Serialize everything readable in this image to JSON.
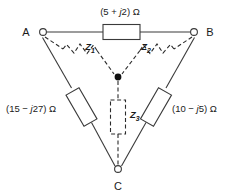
{
  "figure": {
    "stroke_color": "#3a3a3a",
    "dashed_color": "#2b2b2b",
    "text_color": "#1a1a1a",
    "background": "#ffffff"
  },
  "nodes": [
    {
      "id": "A",
      "label": "A",
      "x": 40,
      "y": 32
    },
    {
      "id": "B",
      "label": "B",
      "x": 197,
      "y": 32
    },
    {
      "id": "C",
      "label": "C",
      "x": 118,
      "y": 172
    },
    {
      "id": "N",
      "label": "",
      "x": 118,
      "y": 77
    }
  ],
  "delta_branches": [
    {
      "name": "branch-ab",
      "from": "A",
      "to": "B",
      "label_prefix": "(5 + ",
      "label_imag": "j",
      "label_suffix": "2) Ω",
      "label_full": "(5 + j2) Ω"
    },
    {
      "name": "branch-ac",
      "from": "A",
      "to": "C",
      "label_prefix": "(15 − ",
      "label_imag": "j",
      "label_suffix": "27) Ω",
      "label_full": "(15 − j27) Ω"
    },
    {
      "name": "branch-bc",
      "from": "B",
      "to": "C",
      "label_prefix": "(10 − ",
      "label_imag": "j",
      "label_suffix": "5) Ω",
      "label_full": "(10 − j5) Ω"
    }
  ],
  "wye_branches": [
    {
      "name": "wye-z1",
      "symbol": "Z",
      "subscript": "1",
      "from": "A",
      "to": "N"
    },
    {
      "name": "wye-z2",
      "symbol": "Z",
      "subscript": "2",
      "from": "B",
      "to": "N"
    },
    {
      "name": "wye-z3",
      "symbol": "Z",
      "subscript": "3",
      "from": "C",
      "to": "N"
    }
  ]
}
